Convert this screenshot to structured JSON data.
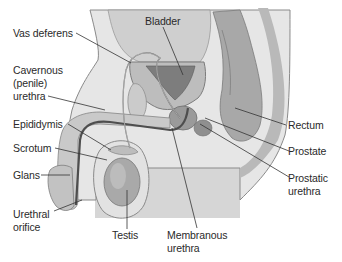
{
  "figure": {
    "colors": {
      "background": "#ffffff",
      "skin": "#e4e4e4",
      "skin_dark": "#b9b9b9",
      "tissue": "#cfcfcf",
      "organ": "#9a9a9a",
      "duct": "#555555",
      "leader": "#333333",
      "text": "#2a2a2a"
    },
    "labels": {
      "vas_deferens": "Vas deferens",
      "bladder": "Bladder",
      "cavernous_1": "Cavernous",
      "cavernous_2": "(penile)",
      "cavernous_3": "urethra",
      "epididymis": "Epididymis",
      "scrotum": "Scrotum",
      "glans": "Glans",
      "urethral_orifice_1": "Urethral",
      "urethral_orifice_2": "orifice",
      "testis": "Testis",
      "membranous_1": "Membranous",
      "membranous_2": "urethra",
      "rectum": "Rectum",
      "prostate": "Prostate",
      "prostatic_1": "Prostatic",
      "prostatic_2": "urethra"
    }
  }
}
